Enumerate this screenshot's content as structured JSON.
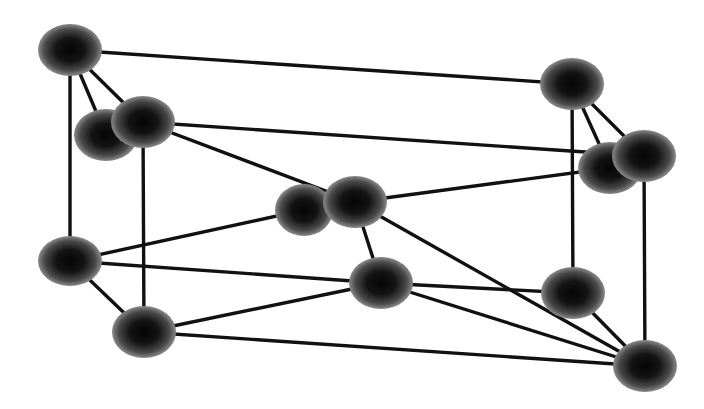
{
  "diagram": {
    "type": "ball-and-stick crystal lattice",
    "background": "#ffffff",
    "bond_color": "#111111",
    "bond_width": 3.4,
    "atom_color_center": "#050505",
    "atom_color_edge": "#8a8a8a",
    "atoms": [
      {
        "id": "A1",
        "x": 70,
        "y": 50,
        "rx": 32,
        "ry": 26
      },
      {
        "id": "B1",
        "x": 572,
        "y": 84,
        "rx": 32,
        "ry": 26
      },
      {
        "id": "A2",
        "x": 106,
        "y": 135,
        "rx": 32,
        "ry": 26
      },
      {
        "id": "A3",
        "x": 143,
        "y": 122,
        "rx": 32,
        "ry": 26
      },
      {
        "id": "B2",
        "x": 610,
        "y": 168,
        "rx": 32,
        "ry": 26
      },
      {
        "id": "B3",
        "x": 644,
        "y": 156,
        "rx": 32,
        "ry": 26
      },
      {
        "id": "C1",
        "x": 304,
        "y": 210,
        "rx": 29,
        "ry": 26
      },
      {
        "id": "C2",
        "x": 355,
        "y": 202,
        "rx": 32,
        "ry": 26
      },
      {
        "id": "D1",
        "x": 70,
        "y": 261,
        "rx": 32,
        "ry": 25
      },
      {
        "id": "D2",
        "x": 144,
        "y": 332,
        "rx": 32,
        "ry": 26
      },
      {
        "id": "D3",
        "x": 381,
        "y": 283,
        "rx": 32,
        "ry": 26
      },
      {
        "id": "D4",
        "x": 573,
        "y": 293,
        "rx": 32,
        "ry": 26
      },
      {
        "id": "D5",
        "x": 645,
        "y": 366,
        "rx": 32,
        "ry": 26
      }
    ],
    "bonds": [
      [
        "A1",
        "B1"
      ],
      [
        "A1",
        "A2"
      ],
      [
        "A1",
        "A3"
      ],
      [
        "A1",
        "D1"
      ],
      [
        "A3",
        "B3"
      ],
      [
        "A3",
        "C2"
      ],
      [
        "A3",
        "D2"
      ],
      [
        "B1",
        "B2"
      ],
      [
        "B1",
        "B3"
      ],
      [
        "B1",
        "D4"
      ],
      [
        "B3",
        "D5"
      ],
      [
        "C1",
        "D1"
      ],
      [
        "C2",
        "B2"
      ],
      [
        "C2",
        "D3"
      ],
      [
        "C2",
        "D5"
      ],
      [
        "D1",
        "D2"
      ],
      [
        "D1",
        "D3"
      ],
      [
        "D2",
        "D3"
      ],
      [
        "D2",
        "D5"
      ],
      [
        "D3",
        "D4"
      ],
      [
        "D3",
        "D5"
      ],
      [
        "D4",
        "D5"
      ]
    ],
    "draw_order": [
      "A1",
      "B1",
      "D4",
      "D1",
      "A2",
      "A3",
      "B2",
      "B3",
      "C1",
      "C2",
      "D3",
      "D2",
      "D5"
    ]
  }
}
